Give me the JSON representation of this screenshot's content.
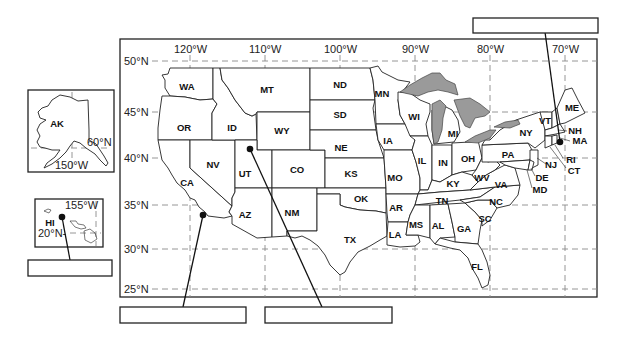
{
  "map": {
    "longitude_labels": [
      "120°W",
      "110°W",
      "100°W",
      "90°W",
      "80°W",
      "70°W"
    ],
    "latitude_labels": [
      "50°N",
      "45°N",
      "40°N",
      "35°N",
      "30°N",
      "25°N"
    ],
    "lake_color": "#9a9a9a",
    "states": {
      "WA": "WA",
      "OR": "OR",
      "CA": "CA",
      "ID": "ID",
      "NV": "NV",
      "MT": "MT",
      "WY": "WY",
      "UT": "UT",
      "CO": "CO",
      "AZ": "AZ",
      "NM": "NM",
      "ND": "ND",
      "SD": "SD",
      "NE": "NE",
      "KS": "KS",
      "OK": "OK",
      "TX": "TX",
      "MN": "MN",
      "IA": "IA",
      "MO": "MO",
      "AR": "AR",
      "LA": "LA",
      "WI": "WI",
      "IL": "IL",
      "MS": "MS",
      "MI": "MI",
      "IN": "IN",
      "KY": "KY",
      "TN": "TN",
      "AL": "AL",
      "OH": "OH",
      "WV": "WV",
      "GA": "GA",
      "FL": "FL",
      "SC": "SC",
      "NC": "NC",
      "VA": "VA",
      "PA": "PA",
      "NY": "NY",
      "VT": "VT",
      "NH": "NH",
      "ME": "ME",
      "MA": "MA",
      "RI": "RI",
      "CT": "CT",
      "NJ": "NJ",
      "DE": "DE",
      "MD": "MD"
    }
  },
  "insets": {
    "alaska": {
      "label": "AK",
      "lat_label": "60°N",
      "lon_label": "150°W"
    },
    "hawaii": {
      "label": "HI",
      "lat_label": "20°N-",
      "lon_label": "155°W"
    }
  },
  "answer_boxes": [
    {
      "id": "hawaii-box",
      "value": ""
    },
    {
      "id": "southwest-box",
      "value": ""
    },
    {
      "id": "utah-box",
      "value": ""
    },
    {
      "id": "northeast-box",
      "value": ""
    }
  ]
}
